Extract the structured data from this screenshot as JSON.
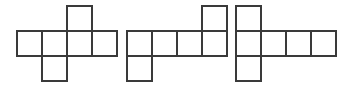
{
  "figure": {
    "background_color": "#ffffff",
    "stroke_color": "#3a3a3a",
    "fill_color": "#ffffff",
    "stroke_width": 1.7,
    "canvas": {
      "width": 350,
      "height": 94
    },
    "grid": {
      "cell_size": 25,
      "row_tops": [
        6,
        31,
        56
      ],
      "row_names": [
        "top",
        "middle",
        "bottom"
      ]
    },
    "shapes": [
      {
        "id": "net-1",
        "label": "First net",
        "origin_x": 17,
        "square_count": 6,
        "squares": [
          {
            "col": 0,
            "row": 1,
            "x": 17,
            "y": 31
          },
          {
            "col": 1,
            "row": 1,
            "x": 42,
            "y": 31
          },
          {
            "col": 2,
            "row": 1,
            "x": 67,
            "y": 31
          },
          {
            "col": 3,
            "row": 1,
            "x": 92,
            "y": 31
          },
          {
            "col": 2,
            "row": 0,
            "x": 67,
            "y": 6
          },
          {
            "col": 1,
            "row": 2,
            "x": 42,
            "y": 56
          }
        ]
      },
      {
        "id": "net-2",
        "label": "Second net",
        "origin_x": 127,
        "square_count": 6,
        "squares": [
          {
            "col": 0,
            "row": 1,
            "x": 127,
            "y": 31
          },
          {
            "col": 1,
            "row": 1,
            "x": 152,
            "y": 31
          },
          {
            "col": 2,
            "row": 1,
            "x": 177,
            "y": 31
          },
          {
            "col": 3,
            "row": 1,
            "x": 202,
            "y": 31
          },
          {
            "col": 3,
            "row": 0,
            "x": 202,
            "y": 6
          },
          {
            "col": 0,
            "row": 2,
            "x": 127,
            "y": 56
          }
        ]
      },
      {
        "id": "net-3",
        "label": "Third net",
        "origin_x": 236,
        "square_count": 6,
        "squares": [
          {
            "col": 0,
            "row": 0,
            "x": 236,
            "y": 6
          },
          {
            "col": 0,
            "row": 1,
            "x": 236,
            "y": 31
          },
          {
            "col": 0,
            "row": 2,
            "x": 236,
            "y": 56
          },
          {
            "col": 1,
            "row": 1,
            "x": 261,
            "y": 31
          },
          {
            "col": 2,
            "row": 1,
            "x": 286,
            "y": 31
          },
          {
            "col": 3,
            "row": 1,
            "x": 311,
            "y": 31
          }
        ]
      }
    ]
  }
}
